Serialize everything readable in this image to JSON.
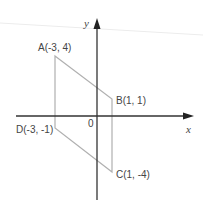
{
  "diagram": {
    "type": "coordinate-plane-parallelogram",
    "axes": {
      "x_label": "x",
      "y_label": "y",
      "origin_label": "0"
    },
    "points": [
      {
        "name": "A",
        "label": "A(-3, 4)",
        "x": -3,
        "y": 4
      },
      {
        "name": "B",
        "label": "B(1, 1)",
        "x": 1,
        "y": 1
      },
      {
        "name": "C",
        "label": "C(1, -4)",
        "x": 1,
        "y": -4
      },
      {
        "name": "D",
        "label": "D(-3, -1)",
        "x": -3,
        "y": -1
      }
    ],
    "colors": {
      "axis": "#333333",
      "shape": "#b0b0b0",
      "text": "#444444",
      "scan_line": "#ececec"
    }
  }
}
